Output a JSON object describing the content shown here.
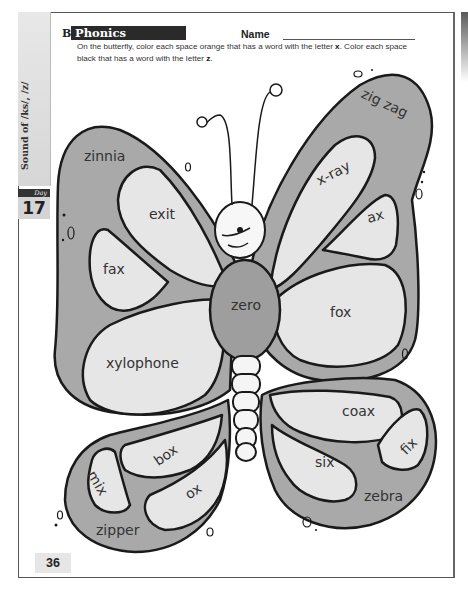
{
  "sidebar": {
    "unit": "Sound of /ks/, /z/",
    "day_label": "Day",
    "day_number": "17"
  },
  "header": {
    "section_letter": "B",
    "section_title": "Phonics",
    "name_label": "Name"
  },
  "instructions": {
    "part1": "On the butterfly, color each space orange that has a word with the letter ",
    "letter_x": "x",
    "part2": ". Color each space black that has a word with the letter ",
    "letter_z": "z",
    "part3": "."
  },
  "colors": {
    "wing_dark": "#a9a9a9",
    "wing_light": "#e6e6e6",
    "outline": "#1a1a1a",
    "body": "#9e9e9e",
    "section_bar": "#2a2a2a"
  },
  "butterfly": {
    "words": [
      {
        "id": "zinnia",
        "text": "zinnia",
        "region": "upper-left outer",
        "shade": "dark"
      },
      {
        "id": "exit",
        "text": "exit",
        "region": "upper-left inner top",
        "shade": "light"
      },
      {
        "id": "fax",
        "text": "fax",
        "region": "upper-left inner bottom",
        "shade": "light"
      },
      {
        "id": "xylophone",
        "text": "xylophone",
        "region": "left middle",
        "shade": "light"
      },
      {
        "id": "zero",
        "text": "zero",
        "region": "thorax",
        "shade": "dark"
      },
      {
        "id": "zig-zag",
        "text": "zig zag",
        "region": "upper-right outer",
        "shade": "dark"
      },
      {
        "id": "x-ray",
        "text": "x-ray",
        "region": "upper-right inner",
        "shade": "light"
      },
      {
        "id": "ax",
        "text": "ax",
        "region": "upper-right inner small",
        "shade": "light"
      },
      {
        "id": "fox",
        "text": "fox",
        "region": "right middle",
        "shade": "light"
      },
      {
        "id": "coax",
        "text": "coax",
        "region": "lower-right top",
        "shade": "light"
      },
      {
        "id": "fix",
        "text": "fix",
        "region": "lower-right tip",
        "shade": "light"
      },
      {
        "id": "six",
        "text": "six",
        "region": "lower-right inner",
        "shade": "light"
      },
      {
        "id": "zebra",
        "text": "zebra",
        "region": "lower-right outer",
        "shade": "dark"
      },
      {
        "id": "box",
        "text": "box",
        "region": "lower-left top",
        "shade": "light"
      },
      {
        "id": "mix",
        "text": "mix",
        "region": "lower-left small",
        "shade": "light"
      },
      {
        "id": "ox",
        "text": "ox",
        "region": "lower-left inner",
        "shade": "light"
      },
      {
        "id": "zipper",
        "text": "zipper",
        "region": "lower-left outer",
        "shade": "dark"
      }
    ]
  },
  "footer": {
    "page_number": "36"
  }
}
